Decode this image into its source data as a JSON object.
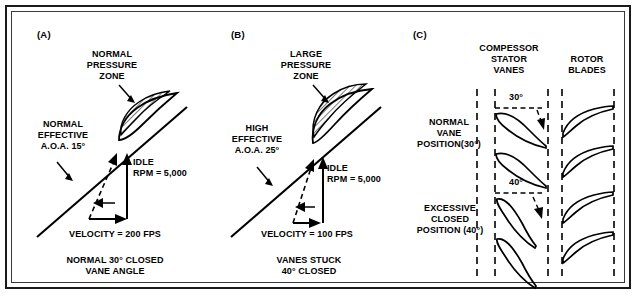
{
  "figure": {
    "panels": [
      {
        "id": "a",
        "letter": "(A)",
        "zone_label": "NORMAL\nPRESSURE\nZONE",
        "aoa_label": "NORMAL\nEFFECTIVE\nA.O.A. 15°",
        "rpm_label": "IDLE\nRPM = 5,000",
        "velocity_label": "VELOCITY = 200 FPS",
        "condition_label": "NORMAL 30° CLOSED\nVANE ANGLE",
        "aoa_degrees": "15°",
        "vane_angle_degrees": "30°",
        "velocity_fps": "200",
        "rpm": "5,000"
      },
      {
        "id": "b",
        "letter": "(B)",
        "zone_label": "LARGE\nPRESSURE\nZONE",
        "aoa_label": "HIGH\nEFFECTIVE\nA.O.A. 25°",
        "rpm_label": "IDLE\nRPM = 5,000",
        "velocity_label": "VELOCITY = 100 FPS",
        "condition_label": "VANES  STUCK\n40°  CLOSED",
        "aoa_degrees": "25°",
        "vane_angle_degrees": "40°",
        "velocity_fps": "100",
        "rpm": "5,000"
      }
    ],
    "panel_c": {
      "letter": "(C)",
      "column_headers": {
        "stator": "COMPESSOR\nSTATOR\nVANES",
        "rotor": "ROTOR\nBLADES"
      },
      "rows": [
        {
          "label": "NORMAL\nVANE\nPOSITION(30°)",
          "angle_label": "30°"
        },
        {
          "label": "EXCESSIVE\nCLOSED\nPOSITION (40°)",
          "angle_label": "40°"
        }
      ]
    },
    "colors": {
      "ink": "#000000",
      "border": "#1a1a1a",
      "hatch": "#000000",
      "background": "#ffffff"
    }
  }
}
